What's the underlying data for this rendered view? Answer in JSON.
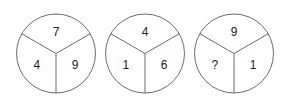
{
  "puzzle": {
    "description": "Number circle puzzle: three circles each divided into three sectors (top, bottom-left, bottom-right)",
    "circles": [
      {
        "top": "7",
        "left": "4",
        "right": "9"
      },
      {
        "top": "4",
        "left": "1",
        "right": "6"
      },
      {
        "top": "9",
        "left": "?",
        "right": "1"
      }
    ],
    "colors": {
      "line": "#6b6b6b",
      "text": "#222222",
      "background": "#ffffff"
    }
  }
}
